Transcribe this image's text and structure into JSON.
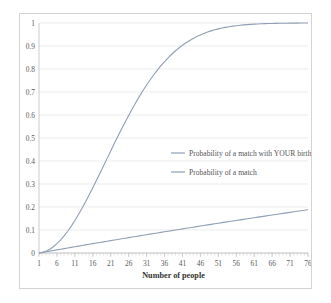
{
  "chart_data": {
    "type": "line",
    "title": "",
    "xlabel": "Number of people",
    "ylabel": "",
    "xlim": [
      1,
      76
    ],
    "ylim": [
      0,
      1
    ],
    "grid": true,
    "legend_position": "center-right",
    "x_tick_labels": [
      "1",
      "6",
      "11",
      "16",
      "21",
      "26",
      "31",
      "36",
      "41",
      "46",
      "51",
      "56",
      "61",
      "66",
      "71",
      "76"
    ],
    "x_tick_values": [
      1,
      6,
      11,
      16,
      21,
      26,
      31,
      36,
      41,
      46,
      51,
      56,
      61,
      66,
      71,
      76
    ],
    "y_tick_labels": [
      "0",
      "0.1",
      "0.2",
      "0.3",
      "0.4",
      "0.5",
      "0.6",
      "0.7",
      "0.8",
      "0.9",
      "1"
    ],
    "y_tick_values": [
      0,
      0.1,
      0.2,
      0.3,
      0.4,
      0.5,
      0.6,
      0.7,
      0.8,
      0.9,
      1
    ],
    "x": [
      1,
      2,
      3,
      4,
      5,
      6,
      7,
      8,
      9,
      10,
      11,
      12,
      13,
      14,
      15,
      16,
      17,
      18,
      19,
      20,
      21,
      22,
      23,
      24,
      25,
      26,
      27,
      28,
      29,
      30,
      31,
      32,
      33,
      34,
      35,
      36,
      37,
      38,
      39,
      40,
      41,
      42,
      43,
      44,
      45,
      46,
      47,
      48,
      49,
      50,
      51,
      52,
      53,
      54,
      55,
      56,
      57,
      58,
      59,
      60,
      61,
      62,
      63,
      64,
      65,
      66,
      67,
      68,
      69,
      70,
      71,
      72,
      73,
      74,
      75,
      76
    ],
    "series": [
      {
        "name": "Probability of a match with YOUR birthday",
        "color": "#8fa0b4",
        "values": [
          0,
          0.0027,
          0.0055,
          0.0082,
          0.0109,
          0.0137,
          0.0164,
          0.0191,
          0.0218,
          0.0245,
          0.0272,
          0.0299,
          0.0326,
          0.0352,
          0.0379,
          0.0406,
          0.0432,
          0.0459,
          0.0485,
          0.0511,
          0.0538,
          0.0564,
          0.059,
          0.0616,
          0.0642,
          0.0668,
          0.0694,
          0.0719,
          0.0745,
          0.0771,
          0.0796,
          0.0822,
          0.0847,
          0.0873,
          0.0898,
          0.0923,
          0.0948,
          0.0974,
          0.0999,
          0.1024,
          0.1049,
          0.1073,
          0.1098,
          0.1123,
          0.1148,
          0.1172,
          0.1197,
          0.1221,
          0.1246,
          0.127,
          0.1295,
          0.1319,
          0.1343,
          0.1367,
          0.1391,
          0.1415,
          0.1439,
          0.1463,
          0.1487,
          0.1511,
          0.1535,
          0.1558,
          0.1582,
          0.1605,
          0.1629,
          0.1652,
          0.1676,
          0.1699,
          0.1722,
          0.1745,
          0.1768,
          0.1791,
          0.1814,
          0.1837,
          0.186,
          0.1883
        ]
      },
      {
        "name": "Probability of a match",
        "color": "#8fa0b4",
        "values": [
          0,
          0.0027,
          0.0082,
          0.0164,
          0.0271,
          0.0405,
          0.0562,
          0.0743,
          0.0946,
          0.1169,
          0.1411,
          0.167,
          0.1944,
          0.2231,
          0.2529,
          0.2836,
          0.315,
          0.3469,
          0.3791,
          0.4114,
          0.4437,
          0.4757,
          0.5073,
          0.5383,
          0.5687,
          0.5982,
          0.6269,
          0.6545,
          0.681,
          0.7063,
          0.7305,
          0.7533,
          0.775,
          0.7953,
          0.8144,
          0.8322,
          0.8487,
          0.8641,
          0.8782,
          0.8912,
          0.9032,
          0.914,
          0.9239,
          0.9329,
          0.941,
          0.9483,
          0.9548,
          0.9606,
          0.9658,
          0.9704,
          0.9744,
          0.978,
          0.9811,
          0.9839,
          0.9863,
          0.9883,
          0.9901,
          0.9917,
          0.993,
          0.9941,
          0.9951,
          0.9959,
          0.9966,
          0.9972,
          0.9977,
          0.9981,
          0.9984,
          0.9987,
          0.999,
          0.9992,
          0.9993,
          0.9995,
          0.9996,
          0.9997,
          0.9997,
          0.9998
        ]
      }
    ],
    "legend": [
      {
        "label": "Probability of a match with YOUR birthday",
        "color": "#8fa0b4"
      },
      {
        "label": "Probability of a match",
        "color": "#8fa0b4"
      }
    ]
  },
  "colors": {
    "frame_border": "#d3d3d3",
    "gridline": "#e4e4e4",
    "axis": "#bfbfbf",
    "tick_text": "#5a5a5a",
    "axis_title": "#333333",
    "series_line": "#8fa0b4"
  }
}
